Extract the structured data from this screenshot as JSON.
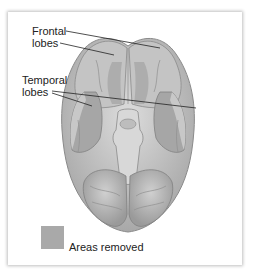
{
  "figure": {
    "labels": {
      "frontal": "Frontal\nlobes",
      "frontal_line1": "Frontal",
      "frontal_line2": "lobes",
      "temporal_line1": "Temporal",
      "temporal_line2": "lobes"
    },
    "legend": {
      "text": "Areas removed",
      "swatch_color": "#a9a9a9"
    },
    "colors": {
      "brain": "#c9c9c9",
      "brain_dark": "#9c9c9c",
      "removed": "#a9a9a9",
      "leader_line": "#222222"
    }
  }
}
